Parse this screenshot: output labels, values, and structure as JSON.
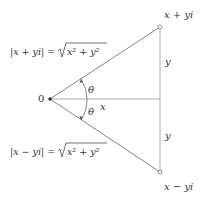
{
  "diagram": {
    "points": {
      "origin": "0",
      "upper": "x + yi",
      "lower": "x − yi"
    },
    "segments": {
      "horizontal": "x",
      "upper_vertical": "y",
      "lower_vertical": "y"
    },
    "angles": {
      "upper": "θ",
      "lower": "θ"
    },
    "equations": {
      "upper": {
        "lhs": "|x + yi| = ",
        "radicand": "x² + y²"
      },
      "lower": {
        "lhs": "|x − yi| = ",
        "radicand": "x² + y²"
      }
    },
    "colors": {
      "line": "#555555",
      "text": "#333333"
    }
  }
}
